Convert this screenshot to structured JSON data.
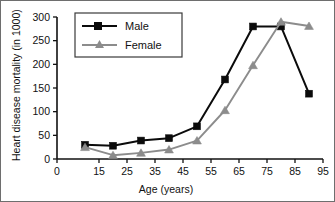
{
  "chart_data": {
    "type": "line",
    "title": "",
    "xlabel": "Age (years)",
    "ylabel": "Heart disease mortality (in 1000)",
    "x": [
      10,
      20,
      30,
      40,
      50,
      60,
      70,
      80,
      90
    ],
    "xtick_labels": [
      "0",
      "15",
      "25",
      "35",
      "45",
      "55",
      "65",
      "75",
      "85",
      "95"
    ],
    "xtick_values": [
      0,
      15,
      25,
      35,
      45,
      55,
      65,
      75,
      85,
      95
    ],
    "ytick_labels": [
      "0",
      "50",
      "100",
      "150",
      "200",
      "250",
      "300"
    ],
    "ytick_values": [
      0,
      50,
      100,
      150,
      200,
      250,
      300
    ],
    "xlim": [
      0,
      95
    ],
    "ylim": [
      0,
      300
    ],
    "grid": false,
    "legend_position": "upper-left",
    "series": [
      {
        "name": "Male",
        "color": "#0b0b0b",
        "marker": "square",
        "values": [
          30,
          28,
          39,
          44,
          69,
          168,
          280,
          280,
          138
        ]
      },
      {
        "name": "Female",
        "color": "#8c8c8c",
        "marker": "triangle",
        "values": [
          25,
          8,
          13,
          20,
          39,
          103,
          198,
          290,
          281
        ]
      }
    ]
  },
  "legend": {
    "items": [
      {
        "label": "Male"
      },
      {
        "label": "Female"
      }
    ]
  },
  "axes": {
    "x_title": "Age (years)",
    "y_title": "Heart disease mortality (in 1000)"
  }
}
